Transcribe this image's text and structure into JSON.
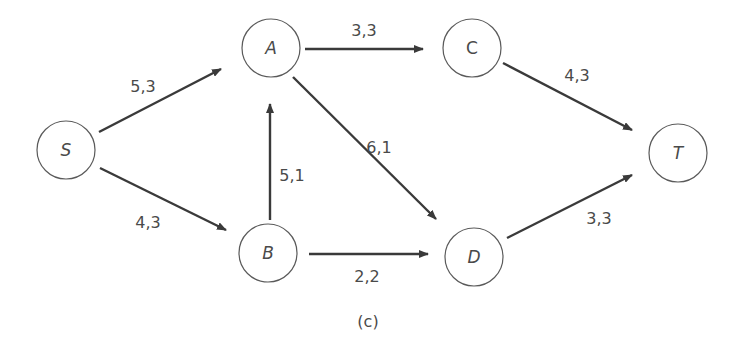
{
  "diagram": {
    "caption": "(c)",
    "caption_pos": [
      368,
      321
    ],
    "colors": {
      "edge": "#3a3a3a",
      "node_stroke": "#5a5a5a",
      "text": "#4a4a4a",
      "background": "#ffffff"
    },
    "node_radius": 29,
    "nodes": [
      {
        "id": "S",
        "label": "S",
        "italic": true,
        "x": 66,
        "y": 150
      },
      {
        "id": "A",
        "label": "A",
        "italic": true,
        "x": 271,
        "y": 48
      },
      {
        "id": "B",
        "label": "B",
        "italic": true,
        "x": 268,
        "y": 253
      },
      {
        "id": "C",
        "label": "C",
        "italic": false,
        "x": 472,
        "y": 48
      },
      {
        "id": "D",
        "label": "D",
        "italic": true,
        "x": 474,
        "y": 257
      },
      {
        "id": "T",
        "label": "T",
        "italic": true,
        "x": 678,
        "y": 153
      }
    ],
    "edges": [
      {
        "from": "S",
        "to": "A",
        "label": "5,3",
        "x1": 99,
        "y1": 132,
        "x2": 221,
        "y2": 69,
        "lx": 143,
        "ly": 86
      },
      {
        "from": "S",
        "to": "B",
        "label": "4,3",
        "x1": 100,
        "y1": 168,
        "x2": 226,
        "y2": 230,
        "lx": 148,
        "ly": 222
      },
      {
        "from": "B",
        "to": "A",
        "label": "5,1",
        "x1": 270,
        "y1": 220,
        "x2": 270,
        "y2": 104,
        "lx": 292,
        "ly": 175
      },
      {
        "from": "A",
        "to": "C",
        "label": "3,3",
        "x1": 305,
        "y1": 49,
        "x2": 423,
        "y2": 49,
        "lx": 364,
        "ly": 30
      },
      {
        "from": "A",
        "to": "D",
        "label": "6,1",
        "x1": 293,
        "y1": 77,
        "x2": 436,
        "y2": 219,
        "lx": 379,
        "ly": 147
      },
      {
        "from": "B",
        "to": "D",
        "label": "2,2",
        "x1": 309,
        "y1": 254,
        "x2": 428,
        "y2": 254,
        "lx": 367,
        "ly": 276
      },
      {
        "from": "C",
        "to": "T",
        "label": "4,3",
        "x1": 503,
        "y1": 63,
        "x2": 632,
        "y2": 130,
        "lx": 577,
        "ly": 75
      },
      {
        "from": "D",
        "to": "T",
        "label": "3,3",
        "x1": 507,
        "y1": 238,
        "x2": 632,
        "y2": 175,
        "lx": 599,
        "ly": 218
      }
    ]
  }
}
